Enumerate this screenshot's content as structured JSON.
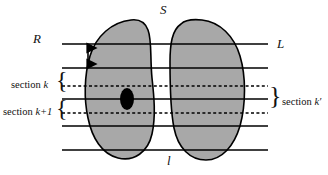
{
  "figure": {
    "title_top": "S",
    "label_left": "R",
    "label_right": "L",
    "label_bottom": "l",
    "section_k": "section k",
    "section_k_plus_1": "section k+1",
    "section_k_prime": "section k′",
    "brace_left_k": "{",
    "brace_left_k1": "{",
    "brace_right": "}",
    "colors": {
      "lobe_fill": "#a8a8a8",
      "outline": "#000000",
      "nodule": "#000000",
      "background": "#ffffff",
      "line": "#000000"
    },
    "geometry": {
      "section_lines_y": [
        44,
        68,
        86,
        99,
        113,
        126,
        150
      ],
      "dashed_lines_y": [
        86,
        113
      ],
      "line_x_start": 62,
      "line_x_end": 268,
      "thickness_arrow_x": 88,
      "thickness_arrow_y_top": 44,
      "thickness_arrow_y_bottom": 68,
      "nodule_cx": 127,
      "nodule_cy": 99,
      "nodule_rx": 7,
      "nodule_ry": 11
    }
  }
}
